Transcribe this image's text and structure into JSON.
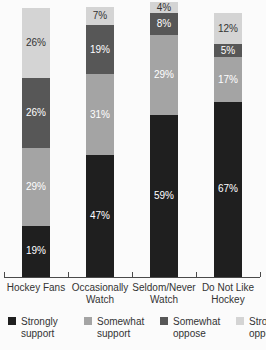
{
  "chart_data": {
    "type": "bar",
    "subtype": "stacked-percentage-column",
    "title": "",
    "xlabel": "",
    "ylabel": "",
    "grid": false,
    "legend_position": "bottom",
    "categories": [
      "Hockey Fans",
      "Occasionally\nWatch",
      "Seldom/Never\nWatch",
      "Do Not Like\nHockey"
    ],
    "series": [
      {
        "name": "Strongly support",
        "color": "#1f1f1f",
        "label_color": "#ffffff",
        "values": [
          19,
          47,
          59,
          67
        ]
      },
      {
        "name": "Somewhat support",
        "color": "#a4a4a4",
        "label_color": "#ffffff",
        "values": [
          29,
          31,
          29,
          17
        ]
      },
      {
        "name": "Somewhat oppose",
        "color": "#575757",
        "label_color": "#ffffff",
        "values": [
          26,
          19,
          8,
          5
        ]
      },
      {
        "name": "Strongly oppose",
        "color": "#d4d4d4",
        "label_color": "#333333",
        "values": [
          26,
          7,
          4,
          12
        ]
      }
    ],
    "data_labels": [
      [
        "19%",
        "47%",
        "59%",
        "67%"
      ],
      [
        "29%",
        "31%",
        "29%",
        "17%"
      ],
      [
        "26%",
        "19%",
        "8%",
        "5%"
      ],
      [
        "26%",
        "7%",
        "4%",
        "12%"
      ]
    ],
    "layout_hints": {
      "axis_y_px": 277,
      "axis_x_start_px": 4,
      "axis_x_end_px": 260,
      "region_width_px": 64,
      "bar_width_px": 28,
      "bar_heights_px": [
        269,
        270,
        275,
        264
      ],
      "stack_order_top_to_bottom": [
        "Strongly oppose",
        "Somewhat oppose",
        "Somewhat support",
        "Strongly support"
      ]
    }
  },
  "legend": {
    "items": [
      {
        "label": "Strongly support",
        "color": "#1f1f1f"
      },
      {
        "label": "Somewhat support",
        "color": "#a4a4a4"
      },
      {
        "label": "Somewhat oppose",
        "color": "#575757"
      },
      {
        "label": "Strongly oppose",
        "color": "#d4d4d4"
      }
    ]
  }
}
